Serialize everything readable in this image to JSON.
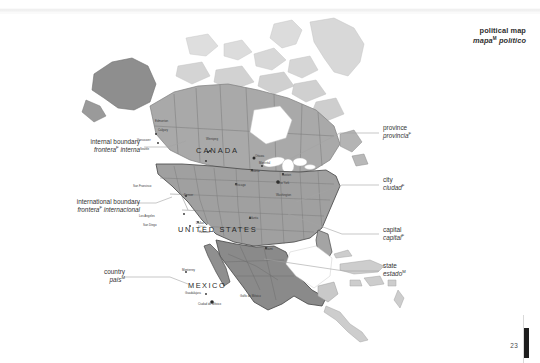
{
  "page": {
    "folio": "23",
    "background_color": "#ffffff"
  },
  "header": {
    "title_en": "political map",
    "title_es": "mapa",
    "title_es_gender": "M",
    "title_es_rest": " político"
  },
  "map": {
    "colors": {
      "canada": "#a9a9a9",
      "canada_alt": "#9a9a9a",
      "alaska": "#8e8e8e",
      "united_states": "#a0a0a0",
      "mexico": "#8a8a8a",
      "other_land": "#cfcfcf",
      "greenland": "#d6d6d6",
      "internal_boundary": "#7c7c7c",
      "international_boundary": "#4a4a4a",
      "ocean": "#ffffff",
      "leader_line": "#9e9e9e"
    },
    "country_labels": [
      {
        "name": "canada",
        "text": "CANADA",
        "x": 196,
        "y": 153
      },
      {
        "name": "united-states",
        "text": "UNITED STATES",
        "x": 178,
        "y": 232
      },
      {
        "name": "mexico",
        "text": "MEXICO",
        "x": 188,
        "y": 288
      }
    ],
    "city_labels": [
      {
        "text": "Edmonton",
        "x": 155,
        "y": 122
      },
      {
        "text": "Calgary",
        "x": 158,
        "y": 131
      },
      {
        "text": "Vancouver",
        "x": 137,
        "y": 141
      },
      {
        "text": "Seattle",
        "x": 140,
        "y": 150
      },
      {
        "text": "Winnipeg",
        "x": 206,
        "y": 140
      },
      {
        "text": "Montréal",
        "x": 259,
        "y": 164
      },
      {
        "text": "Toronto",
        "x": 250,
        "y": 172
      },
      {
        "text": "Ottawa",
        "x": 255,
        "y": 157
      },
      {
        "text": "Chicago",
        "x": 235,
        "y": 186
      },
      {
        "text": "Boston",
        "x": 282,
        "y": 176
      },
      {
        "text": "New York",
        "x": 277,
        "y": 184
      },
      {
        "text": "Washington",
        "x": 276,
        "y": 196
      },
      {
        "text": "Denver",
        "x": 184,
        "y": 196
      },
      {
        "text": "San Francisco",
        "x": 133,
        "y": 187
      },
      {
        "text": "Los Angeles",
        "x": 139,
        "y": 217
      },
      {
        "text": "San Diego",
        "x": 143,
        "y": 226
      },
      {
        "text": "Dallas",
        "x": 196,
        "y": 224
      },
      {
        "text": "Houston",
        "x": 199,
        "y": 233
      },
      {
        "text": "Atlanta",
        "x": 249,
        "y": 219
      },
      {
        "text": "Miami",
        "x": 265,
        "y": 250
      },
      {
        "text": "Monterrey",
        "x": 182,
        "y": 271
      },
      {
        "text": "Guadalajara",
        "x": 185,
        "y": 294
      },
      {
        "text": "Ciudad de México",
        "x": 198,
        "y": 305
      },
      {
        "text": "Golfo de México",
        "x": 240,
        "y": 297
      }
    ]
  },
  "callouts": [
    {
      "name": "internal-boundary",
      "side": "left",
      "en": "internal boundary",
      "es": "frontera",
      "es_gender": "F",
      "es_rest": " interna",
      "label_x": 56,
      "label_y": 138,
      "line": [
        {
          "x": 144,
          "y": 147
        },
        {
          "x": 168,
          "y": 147
        },
        {
          "x": 183,
          "y": 140
        }
      ]
    },
    {
      "name": "international-boundary",
      "side": "left",
      "en": "international boundary",
      "es": "frontera",
      "es_gender": "F",
      "es_rest": " internacional",
      "label_x": 34,
      "label_y": 198,
      "line": [
        {
          "x": 134,
          "y": 203
        },
        {
          "x": 154,
          "y": 203
        },
        {
          "x": 170,
          "y": 197
        }
      ]
    },
    {
      "name": "country",
      "side": "left",
      "en": "country",
      "es": "país",
      "es_gender": "M",
      "es_rest": "",
      "label_x": 84,
      "label_y": 268,
      "line": [
        {
          "x": 124,
          "y": 277
        },
        {
          "x": 168,
          "y": 277
        },
        {
          "x": 186,
          "y": 283
        }
      ]
    },
    {
      "name": "province",
      "side": "right",
      "en": "province",
      "es": "provincia",
      "es_gender": "F",
      "es_rest": "",
      "label_x": 383,
      "label_y": 124,
      "line": [
        {
          "x": 379,
          "y": 133
        },
        {
          "x": 340,
          "y": 133
        },
        {
          "x": 288,
          "y": 158
        }
      ]
    },
    {
      "name": "city",
      "side": "right",
      "en": "city",
      "es": "ciudad",
      "es_gender": "F",
      "es_rest": "",
      "label_x": 383,
      "label_y": 176,
      "line": [
        {
          "x": 379,
          "y": 185
        },
        {
          "x": 340,
          "y": 185
        },
        {
          "x": 292,
          "y": 201
        }
      ]
    },
    {
      "name": "capital",
      "side": "right",
      "en": "capital",
      "es": "capital",
      "es_gender": "F",
      "es_rest": "",
      "label_x": 383,
      "label_y": 226,
      "line": [
        {
          "x": 379,
          "y": 234
        },
        {
          "x": 340,
          "y": 234
        },
        {
          "x": 286,
          "y": 213
        }
      ]
    },
    {
      "name": "state",
      "side": "right",
      "en": "state",
      "es": "estado",
      "es_gender": "M",
      "es_rest": "",
      "label_x": 383,
      "label_y": 262,
      "line": [
        {
          "x": 379,
          "y": 271
        },
        {
          "x": 340,
          "y": 271
        },
        {
          "x": 262,
          "y": 258
        }
      ]
    }
  ]
}
